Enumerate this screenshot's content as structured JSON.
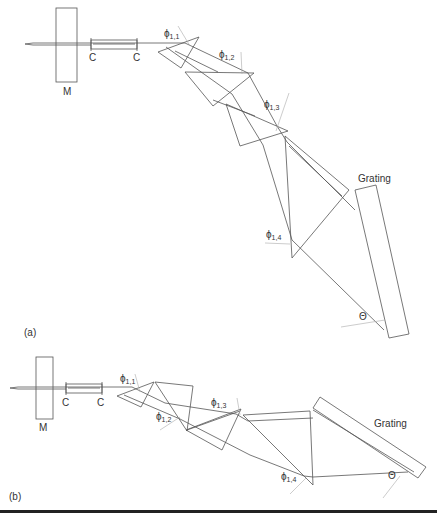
{
  "panels": [
    {
      "label": "(a)",
      "mirror_label": "M",
      "collimator_labels": [
        "C",
        "C"
      ],
      "angle_labels": [
        {
          "sym": "ϕ",
          "sub": "1,1"
        },
        {
          "sym": "ϕ",
          "sub": "1,2"
        },
        {
          "sym": "ϕ",
          "sub": "1,3"
        },
        {
          "sym": "ϕ",
          "sub": "1,4"
        }
      ],
      "grating_label": "Grating",
      "theta_label": "Θ"
    },
    {
      "label": "(b)",
      "mirror_label": "M",
      "collimator_labels": [
        "C",
        "C"
      ],
      "angle_labels": [
        {
          "sym": "ϕ",
          "sub": "1,1"
        },
        {
          "sym": "ϕ",
          "sub": "1,2"
        },
        {
          "sym": "ϕ",
          "sub": "1,3"
        },
        {
          "sym": "ϕ",
          "sub": "1,4"
        }
      ],
      "grating_label": "Grating",
      "theta_label": "Θ"
    }
  ],
  "colors": {
    "line": "#555555",
    "normal": "#aaaaaa",
    "text": "#333333"
  }
}
